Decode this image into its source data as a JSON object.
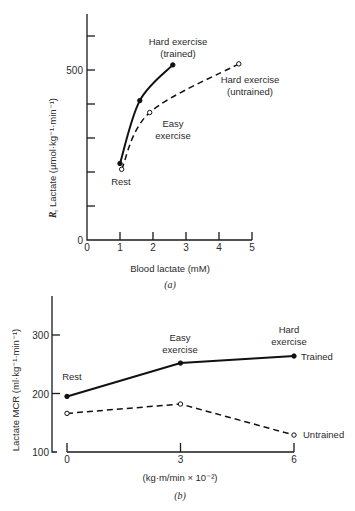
{
  "chart_data": [
    {
      "panel": "(a)",
      "type": "line",
      "xlabel": "Blood lactate (mM)",
      "ylabel": "Rt Lactate (µmol·kg⁻¹·min⁻¹)",
      "ylabel_sym": "R",
      "ylabel_sub": "t",
      "ylabel_rest": "Lactate (µmol·kg⁻¹·min⁻¹)",
      "xlim": [
        0,
        5
      ],
      "ylim": [
        0,
        600
      ],
      "xticks": [
        "0",
        "1",
        "2",
        "3",
        "4",
        "5"
      ],
      "yticks_labeled": [
        "0",
        "500"
      ],
      "ytick_values": [
        0,
        100,
        200,
        300,
        400,
        500,
        600
      ],
      "series": [
        {
          "name": "Trained",
          "style": "solid, filled markers",
          "points": [
            {
              "x": 1.0,
              "y": 225,
              "label": "Rest"
            },
            {
              "x": 1.6,
              "y": 410,
              "label": "Easy exercise"
            },
            {
              "x": 2.6,
              "y": 515,
              "label": "Hard exercise (trained)"
            }
          ]
        },
        {
          "name": "Untrained",
          "style": "dashed, open markers",
          "points": [
            {
              "x": 1.05,
              "y": 208,
              "label": "Rest"
            },
            {
              "x": 1.9,
              "y": 375,
              "label": "Easy exercise"
            },
            {
              "x": 4.6,
              "y": 518,
              "label": "Hard exercise (untrained)"
            }
          ]
        }
      ],
      "annotations": {
        "hard_trained_1": "Hard exercise",
        "hard_trained_2": "(trained)",
        "hard_untrained_1": "Hard exercise",
        "hard_untrained_2": "(untrained)",
        "easy_1": "Easy",
        "easy_2": "exercise",
        "rest": "Rest"
      },
      "caption": "(a)",
      "grid": false
    },
    {
      "panel": "(b)",
      "type": "line",
      "xlabel": "(kg·m/min × 10⁻²)",
      "ylabel": "Lactate MCR (ml·kg⁻¹·min⁻¹)",
      "xlim": [
        0,
        6
      ],
      "ylim": [
        100,
        360
      ],
      "xticks": [
        "0",
        "3",
        "6"
      ],
      "yticks": [
        "100",
        "200",
        "300"
      ],
      "series": [
        {
          "name": "Trained",
          "style": "solid, filled markers",
          "points": [
            {
              "x": 0,
              "y": 195
            },
            {
              "x": 3,
              "y": 252
            },
            {
              "x": 6,
              "y": 264
            }
          ]
        },
        {
          "name": "Untrained",
          "style": "dashed, open markers",
          "points": [
            {
              "x": 0,
              "y": 166
            },
            {
              "x": 3,
              "y": 182
            },
            {
              "x": 6,
              "y": 129
            }
          ]
        }
      ],
      "annotations": {
        "rest": "Rest",
        "easy_1": "Easy",
        "easy_2": "exercise",
        "hard_1": "Hard",
        "hard_2": "exercise",
        "trained": "Trained",
        "untrained": "Untrained"
      },
      "caption": "(b)",
      "grid": false
    }
  ]
}
